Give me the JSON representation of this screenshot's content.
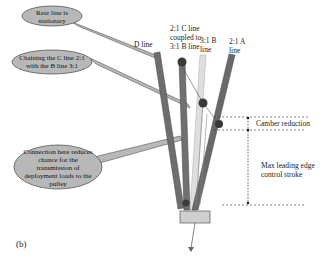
{
  "figure": {
    "panel_label": "(b)",
    "callouts": [
      {
        "id": "rear-line",
        "text": "Rear line is stationary"
      },
      {
        "id": "chaining",
        "text": "Chaining the C line 2:1 with the B line 3:1"
      },
      {
        "id": "connection",
        "text": "Connection here reduces chance for the transmission of deployment loads to the pulley"
      }
    ],
    "line_labels": {
      "d_line": "D line",
      "c_line": "2:1 C line coupled to 3:1 B line",
      "b_line": "3:1 B line",
      "a_line": "2:1 A line"
    },
    "dimensions": {
      "camber": "Camber reduction",
      "leading_edge": "Max leading edge control stroke"
    },
    "colors": {
      "bubble_fill": "#b8b8b8",
      "bubble_stroke": "#555555",
      "line_dark": "#6e6e6e",
      "line_light": "#d8d8d8",
      "pulley": "#3a3a3a",
      "base": "#cfcfcf"
    }
  }
}
